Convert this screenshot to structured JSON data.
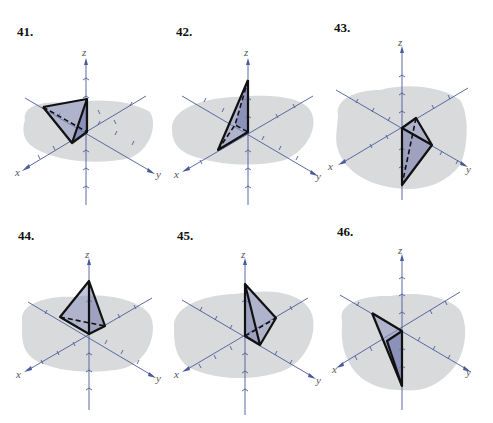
{
  "page": {
    "colors": {
      "axis": "#4a5a9a",
      "plane": "#d9dadc",
      "solid_fill": "#8d93bf",
      "edge": "#111111"
    }
  },
  "figures": [
    {
      "number": "41.",
      "axes": {
        "x": "x",
        "y": "y",
        "z": "z"
      }
    },
    {
      "number": "42.",
      "axes": {
        "x": "x",
        "y": "y",
        "z": "z"
      }
    },
    {
      "number": "43.",
      "axes": {
        "x": "x",
        "y": "y",
        "z": "z"
      }
    },
    {
      "number": "44.",
      "axes": {
        "x": "x",
        "y": "y",
        "z": "z"
      }
    },
    {
      "number": "45.",
      "axes": {
        "x": "x",
        "y": "y",
        "z": "z"
      }
    },
    {
      "number": "46.",
      "axes": {
        "x": "x",
        "y": "y",
        "z": "z"
      }
    }
  ]
}
